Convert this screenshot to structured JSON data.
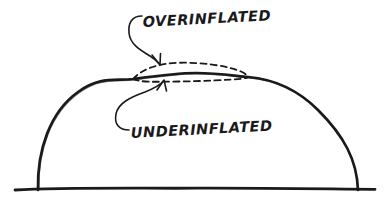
{
  "figure": {
    "type": "hand-drawn-diagram",
    "background_color": "#ffffff",
    "ink_color": "#1a1a1a"
  },
  "labels": {
    "over": "OVERINFLATED",
    "under": "UNDERINFLATED"
  },
  "annotations": [
    {
      "id": "over-inflated",
      "text": "OVERINFLATED",
      "text_anchor_x": 143,
      "text_anchor_y": 26,
      "font_size": 13,
      "leader": "hook-curve-down-right",
      "arrow_tip_x": 159,
      "arrow_tip_y": 64,
      "points_to": "upper-dashed-arc"
    },
    {
      "id": "under-inflated",
      "text": "UNDERINFLATED",
      "text_anchor_x": 131,
      "text_anchor_y": 137,
      "font_size": 13,
      "leader": "hook-curve-up-right",
      "arrow_tip_x": 163,
      "arrow_tip_y": 81,
      "points_to": "lower-dashed-arc"
    }
  ],
  "geometry": {
    "ground_line": {
      "x1": 15,
      "y1": 190,
      "x2": 375,
      "y2": 189
    },
    "dome_left_foot": {
      "x": 38,
      "y": 190
    },
    "dome_right_foot": {
      "x": 358,
      "y": 190
    },
    "dome_apex": {
      "x": 196,
      "y": 73
    },
    "junction_left": {
      "x": 133,
      "y": 79
    },
    "junction_right": {
      "x": 248,
      "y": 77
    },
    "upper_dashed_apex": {
      "x": 190,
      "y": 63
    },
    "lower_dashed_apex": {
      "x": 190,
      "y": 81
    },
    "stroke_width_solid": 2.6,
    "stroke_width_dashed": 1.7,
    "dash_pattern": "6 4"
  },
  "colors": {
    "ink": "#1a1a1a",
    "paper": "#ffffff"
  }
}
